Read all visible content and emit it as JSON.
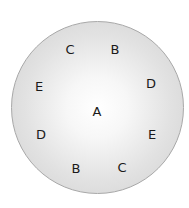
{
  "diagram": {
    "center_label": "A",
    "ring_labels": [
      {
        "text": "C",
        "x": 70,
        "y": 49
      },
      {
        "text": "B",
        "x": 115,
        "y": 49
      },
      {
        "text": "E",
        "x": 39,
        "y": 86
      },
      {
        "text": "D",
        "x": 151,
        "y": 83
      },
      {
        "text": "A",
        "x": 97,
        "y": 111
      },
      {
        "text": "D",
        "x": 41,
        "y": 134
      },
      {
        "text": "E",
        "x": 152,
        "y": 134
      },
      {
        "text": "B",
        "x": 76,
        "y": 168
      },
      {
        "text": "C",
        "x": 122,
        "y": 167
      }
    ],
    "colors": {
      "disc_edge": "#a8a8a8",
      "disc_center": "#ffffff",
      "disc_rim": "#cfcfcf",
      "text": "#1a1a1a"
    }
  }
}
